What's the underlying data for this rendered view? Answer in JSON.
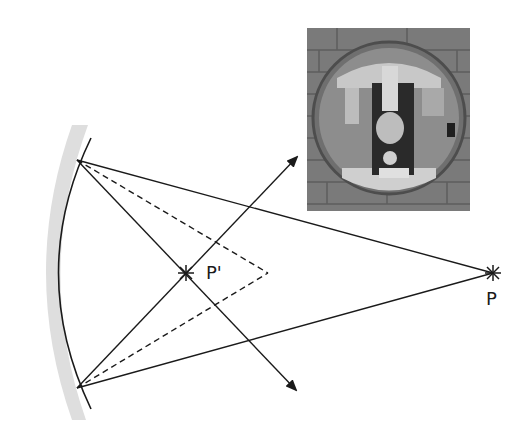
{
  "figure": {
    "type": "concave-mirror-ray-diagram",
    "labels": {
      "object_point": "P",
      "image_point": "P'"
    },
    "photo": {
      "description": "Photograph of a round convex security mirror mounted on a brick wall, showing an inverted reflection of a person and doorway"
    },
    "colors": {
      "ray": "#1a1a1a",
      "mirror_backing": "#dedede",
      "photo_bg": "#7d7d7d"
    }
  }
}
